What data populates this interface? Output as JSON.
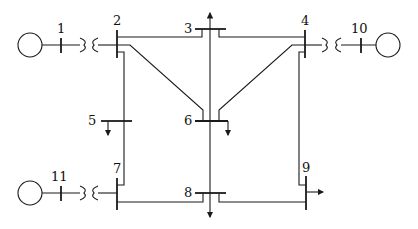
{
  "diagram": {
    "buses": [
      {
        "id": "1",
        "label": "1"
      },
      {
        "id": "2",
        "label": "2"
      },
      {
        "id": "3",
        "label": "3"
      },
      {
        "id": "4",
        "label": "4"
      },
      {
        "id": "5",
        "label": "5"
      },
      {
        "id": "6",
        "label": "6"
      },
      {
        "id": "7",
        "label": "7"
      },
      {
        "id": "8",
        "label": "8"
      },
      {
        "id": "9",
        "label": "9"
      },
      {
        "id": "10",
        "label": "10"
      },
      {
        "id": "11",
        "label": "11"
      }
    ],
    "generators": [
      "1",
      "10",
      "11"
    ],
    "transformers": [
      [
        "1",
        "2"
      ],
      [
        "4",
        "10"
      ],
      [
        "11",
        "7"
      ]
    ],
    "lines": [
      [
        "2",
        "3"
      ],
      [
        "3",
        "4"
      ],
      [
        "2",
        "6"
      ],
      [
        "4",
        "6"
      ],
      [
        "2",
        "5"
      ],
      [
        "5",
        "7"
      ],
      [
        "7",
        "8"
      ],
      [
        "8",
        "9"
      ],
      [
        "4",
        "9"
      ],
      [
        "3",
        "6"
      ],
      [
        "6",
        "8"
      ]
    ],
    "loads": [
      "3",
      "5",
      "6",
      "8",
      "9"
    ]
  }
}
